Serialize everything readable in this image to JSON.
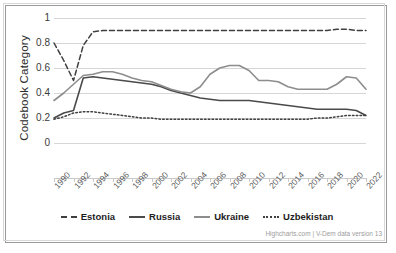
{
  "chart": {
    "y_axis_title": "Codebook Category",
    "credits": "Highcharts.com | V-Dem data version 13"
  },
  "legend": {
    "items": [
      {
        "label": "Estonia",
        "style": "dashed",
        "color": "#3f3f3f"
      },
      {
        "label": "Russia",
        "style": "solid",
        "color": "#4a4a4a"
      },
      {
        "label": "Ukraine",
        "style": "solid",
        "color": "#8d8d8d"
      },
      {
        "label": "Uzbekistan",
        "style": "dotted",
        "color": "#3f3f3f"
      }
    ]
  },
  "chart_data": {
    "type": "line",
    "title": "",
    "xlabel": "",
    "ylabel": "Codebook Category",
    "ylim": [
      0,
      1
    ],
    "yticks": [
      0,
      0.2,
      0.4,
      0.6,
      0.8,
      1
    ],
    "xlim": [
      1990,
      2022
    ],
    "xticks": [
      1990,
      1992,
      1994,
      1996,
      1998,
      2000,
      2002,
      2004,
      2006,
      2008,
      2010,
      2012,
      2014,
      2016,
      2018,
      2020,
      2022
    ],
    "grid": true,
    "legend_position": "bottom",
    "x": [
      1990,
      1991,
      1992,
      1993,
      1994,
      1995,
      1996,
      1997,
      1998,
      1999,
      2000,
      2001,
      2002,
      2003,
      2004,
      2005,
      2006,
      2007,
      2008,
      2009,
      2010,
      2011,
      2012,
      2013,
      2014,
      2015,
      2016,
      2017,
      2018,
      2019,
      2020,
      2021,
      2022
    ],
    "series": [
      {
        "name": "Estonia",
        "style": "dashed",
        "color": "#3f3f3f",
        "values": [
          0.8,
          0.66,
          0.5,
          0.78,
          0.89,
          0.9,
          0.9,
          0.9,
          0.9,
          0.9,
          0.9,
          0.9,
          0.9,
          0.9,
          0.9,
          0.9,
          0.9,
          0.9,
          0.9,
          0.9,
          0.9,
          0.9,
          0.9,
          0.9,
          0.9,
          0.9,
          0.9,
          0.9,
          0.9,
          0.91,
          0.91,
          0.9,
          0.9
        ]
      },
      {
        "name": "Russia",
        "style": "solid",
        "color": "#4a4a4a",
        "values": [
          0.2,
          0.24,
          0.26,
          0.52,
          0.53,
          0.52,
          0.51,
          0.5,
          0.49,
          0.48,
          0.47,
          0.45,
          0.42,
          0.4,
          0.38,
          0.36,
          0.35,
          0.34,
          0.34,
          0.34,
          0.34,
          0.33,
          0.32,
          0.31,
          0.3,
          0.29,
          0.28,
          0.27,
          0.27,
          0.27,
          0.27,
          0.26,
          0.22
        ]
      },
      {
        "name": "Ukraine",
        "style": "solid",
        "color": "#8d8d8d",
        "values": [
          0.34,
          0.4,
          0.47,
          0.54,
          0.55,
          0.57,
          0.57,
          0.55,
          0.52,
          0.5,
          0.49,
          0.46,
          0.43,
          0.41,
          0.4,
          0.45,
          0.55,
          0.6,
          0.62,
          0.62,
          0.58,
          0.5,
          0.5,
          0.49,
          0.45,
          0.43,
          0.43,
          0.43,
          0.43,
          0.47,
          0.53,
          0.52,
          0.43
        ]
      },
      {
        "name": "Uzbekistan",
        "style": "dotted",
        "color": "#3f3f3f",
        "values": [
          0.19,
          0.21,
          0.24,
          0.25,
          0.25,
          0.24,
          0.23,
          0.22,
          0.21,
          0.2,
          0.2,
          0.19,
          0.19,
          0.19,
          0.19,
          0.19,
          0.19,
          0.19,
          0.19,
          0.19,
          0.19,
          0.19,
          0.19,
          0.19,
          0.19,
          0.19,
          0.19,
          0.2,
          0.2,
          0.21,
          0.22,
          0.22,
          0.22
        ]
      }
    ]
  }
}
